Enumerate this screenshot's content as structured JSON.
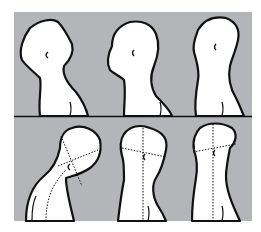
{
  "figure": {
    "colors": {
      "panel_background": "#b4b5b8",
      "figure_fill": "#ffffff",
      "outline": "#111111",
      "page_background": "#ffffff"
    },
    "rows": [
      {
        "row": "top",
        "panels": [
          "head-tilted-back",
          "head-neutral",
          "head-upright"
        ]
      },
      {
        "row": "bottom",
        "panels": [
          "head-forward-flexed-with-guides",
          "head-forward-with-guides",
          "head-upright-with-guides"
        ]
      }
    ]
  }
}
